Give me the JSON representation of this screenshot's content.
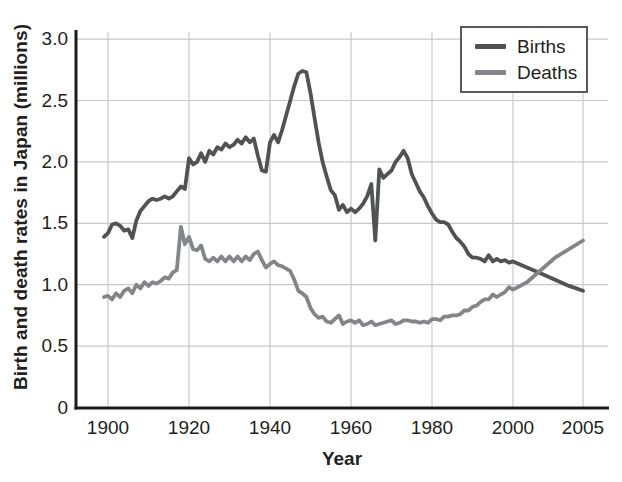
{
  "chart_data": {
    "type": "line",
    "title": "",
    "xlabel": "Year",
    "ylabel": "Birth and death rates in Japan (millions)",
    "grid": true,
    "legend_position": "top-right",
    "axis_color": "#1c1c1c",
    "grid_color": "#c9c9c9",
    "text_color": "#231f20",
    "ylim": [
      0,
      3.1
    ],
    "y_ticks": [
      {
        "label": "0",
        "value": 0
      },
      {
        "label": "0.5",
        "value": 0.5
      },
      {
        "label": "1.0",
        "value": 1.0
      },
      {
        "label": "1.5",
        "value": 1.5
      },
      {
        "label": "2.0",
        "value": 2.0
      },
      {
        "label": "2.5",
        "value": 2.5
      },
      {
        "label": "3.0",
        "value": 3.0
      }
    ],
    "x_ticks": [
      {
        "label": "1900",
        "year": 1900
      },
      {
        "label": "1920",
        "year": 1920
      },
      {
        "label": "1940",
        "year": 1940
      },
      {
        "label": "1960",
        "year": 1960
      },
      {
        "label": "1980",
        "year": 1980
      },
      {
        "label": "2000",
        "year": 2000
      },
      {
        "label": "2005",
        "year": 2005
      }
    ],
    "x_axis_note": "linear 1900-2000; final 2005 tick compressed near right edge",
    "years": [
      1899,
      1900,
      1901,
      1902,
      1903,
      1904,
      1905,
      1906,
      1907,
      1908,
      1909,
      1910,
      1911,
      1912,
      1913,
      1914,
      1915,
      1916,
      1917,
      1918,
      1919,
      1920,
      1921,
      1922,
      1923,
      1924,
      1925,
      1926,
      1927,
      1928,
      1929,
      1930,
      1931,
      1932,
      1933,
      1934,
      1935,
      1936,
      1937,
      1938,
      1939,
      1940,
      1941,
      1942,
      1943,
      1944,
      1945,
      1946,
      1947,
      1948,
      1949,
      1950,
      1951,
      1952,
      1953,
      1954,
      1955,
      1956,
      1957,
      1958,
      1959,
      1960,
      1961,
      1962,
      1963,
      1964,
      1965,
      1966,
      1967,
      1968,
      1969,
      1970,
      1971,
      1972,
      1973,
      1974,
      1975,
      1976,
      1977,
      1978,
      1979,
      1980,
      1981,
      1982,
      1983,
      1984,
      1985,
      1986,
      1987,
      1988,
      1989,
      1990,
      1991,
      1992,
      1993,
      1994,
      1995,
      1996,
      1997,
      1998,
      1999,
      2000,
      2001,
      2002,
      2003,
      2004,
      2005
    ],
    "series": [
      {
        "name": "Births",
        "color": "#515254",
        "values": [
          1.39,
          1.42,
          1.49,
          1.5,
          1.48,
          1.44,
          1.45,
          1.38,
          1.52,
          1.6,
          1.64,
          1.68,
          1.7,
          1.69,
          1.7,
          1.72,
          1.7,
          1.72,
          1.76,
          1.8,
          1.78,
          2.03,
          1.98,
          2.0,
          2.07,
          2.0,
          2.09,
          2.06,
          2.12,
          2.1,
          2.15,
          2.12,
          2.14,
          2.18,
          2.15,
          2.2,
          2.16,
          2.19,
          2.05,
          1.93,
          1.92,
          2.16,
          2.22,
          2.16,
          2.26,
          2.38,
          2.5,
          2.62,
          2.72,
          2.74,
          2.73,
          2.56,
          2.36,
          2.16,
          2.0,
          1.88,
          1.77,
          1.73,
          1.61,
          1.65,
          1.59,
          1.62,
          1.59,
          1.62,
          1.66,
          1.72,
          1.82,
          1.36,
          1.94,
          1.87,
          1.9,
          1.93,
          2.0,
          2.04,
          2.09,
          2.03,
          1.9,
          1.83,
          1.76,
          1.71,
          1.64,
          1.58,
          1.53,
          1.51,
          1.51,
          1.49,
          1.43,
          1.38,
          1.35,
          1.31,
          1.25,
          1.22,
          1.22,
          1.21,
          1.19,
          1.24,
          1.19,
          1.21,
          1.19,
          1.2,
          1.18,
          1.19,
          1.14,
          1.09,
          1.04,
          0.99,
          0.95
        ]
      },
      {
        "name": "Deaths",
        "color": "#838588",
        "values": [
          0.9,
          0.91,
          0.88,
          0.93,
          0.9,
          0.95,
          0.97,
          0.93,
          1.0,
          0.97,
          1.02,
          0.99,
          1.02,
          1.01,
          1.03,
          1.06,
          1.05,
          1.1,
          1.12,
          1.47,
          1.33,
          1.39,
          1.29,
          1.28,
          1.32,
          1.21,
          1.19,
          1.22,
          1.19,
          1.23,
          1.19,
          1.23,
          1.19,
          1.23,
          1.19,
          1.23,
          1.2,
          1.25,
          1.27,
          1.2,
          1.14,
          1.17,
          1.19,
          1.16,
          1.15,
          1.13,
          1.11,
          1.04,
          0.95,
          0.93,
          0.9,
          0.81,
          0.76,
          0.73,
          0.74,
          0.7,
          0.69,
          0.72,
          0.75,
          0.68,
          0.7,
          0.71,
          0.69,
          0.71,
          0.67,
          0.68,
          0.7,
          0.67,
          0.68,
          0.69,
          0.7,
          0.71,
          0.68,
          0.69,
          0.71,
          0.71,
          0.7,
          0.7,
          0.69,
          0.7,
          0.69,
          0.72,
          0.72,
          0.71,
          0.74,
          0.74,
          0.75,
          0.75,
          0.76,
          0.79,
          0.79,
          0.82,
          0.83,
          0.86,
          0.88,
          0.88,
          0.92,
          0.9,
          0.92,
          0.94,
          0.98,
          0.96,
          1.02,
          1.12,
          1.22,
          1.29,
          1.36
        ]
      }
    ]
  }
}
